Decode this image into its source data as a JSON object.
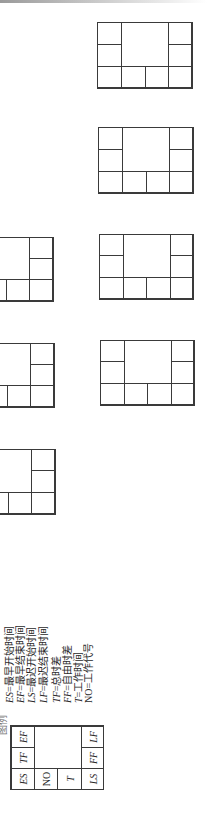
{
  "diagram": {
    "type": "network-node-legend",
    "orientation": "rotated-90-ccw",
    "legend_title_partial": "图例",
    "legend_box": {
      "cells": {
        "top_left": "ES",
        "top_mid": "TF",
        "top_right": "EF",
        "mid_left": "NO",
        "mid_right": "",
        "lower_left": "T",
        "bottom_left": "LS",
        "bottom_mid": "FF",
        "bottom_right": "LF"
      }
    },
    "definitions": [
      {
        "abbr": "ES",
        "text": "=最早开始时间"
      },
      {
        "abbr": "EF",
        "text": "=最早结束时间"
      },
      {
        "abbr": "LS",
        "text": "=最迟开始时间"
      },
      {
        "abbr": "LF",
        "text": "=最迟结束时间"
      },
      {
        "abbr": "TF",
        "text": "=总时差"
      },
      {
        "abbr": "FF",
        "text": "=自由时差"
      },
      {
        "abbr": "T",
        "text": "=工作时间"
      },
      {
        "abbr": "NO",
        "text": "=工作代号"
      }
    ],
    "empty_node_boxes": [
      {
        "id": "right-1",
        "x": 97,
        "y": 22,
        "w": 95,
        "h": 66,
        "cut": false
      },
      {
        "id": "right-2",
        "x": 98,
        "y": 127,
        "w": 95,
        "h": 66,
        "cut": false
      },
      {
        "id": "right-3",
        "x": 99,
        "y": 234,
        "w": 94,
        "h": 65,
        "cut": false
      },
      {
        "id": "right-4",
        "x": 100,
        "y": 340,
        "w": 94,
        "h": 65,
        "cut": false
      },
      {
        "id": "left-1",
        "x": -42,
        "y": 237,
        "w": 95,
        "h": 64,
        "cut": true
      },
      {
        "id": "left-2",
        "x": -41,
        "y": 343,
        "w": 95,
        "h": 64,
        "cut": true
      },
      {
        "id": "left-3",
        "x": -40,
        "y": 449,
        "w": 95,
        "h": 65,
        "cut": true
      }
    ],
    "colors": {
      "line": "#3a3a3a",
      "text": "#2a2a2a",
      "background": "#ffffff"
    }
  }
}
